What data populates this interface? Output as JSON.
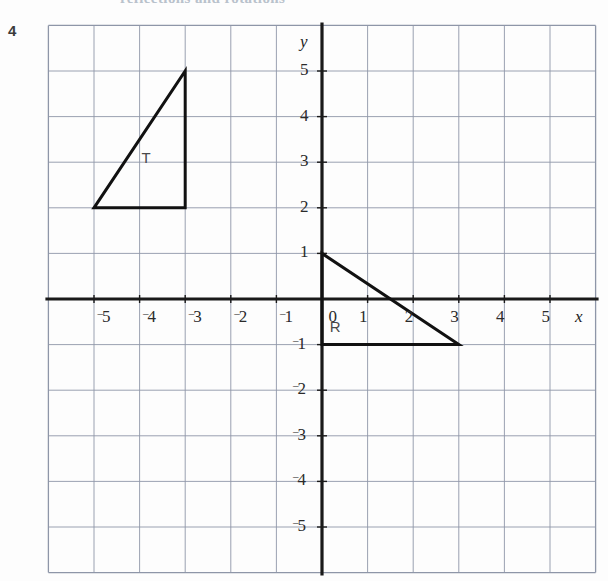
{
  "page": {
    "question_number": "4",
    "cropped_heading": "reflections and rotations"
  },
  "axes": {
    "x_axis_name": "x",
    "y_axis_name": "y",
    "origin_label": "0",
    "x_tick_labels": [
      "⁻5",
      "⁻4",
      "⁻3",
      "⁻2",
      "⁻1",
      "0",
      "1",
      "2",
      "3",
      "4",
      "5"
    ],
    "y_tick_labels": [
      "5",
      "4",
      "3",
      "2",
      "1",
      "⁻1",
      "⁻2",
      "⁻3",
      "⁻4",
      "⁻5"
    ],
    "grid_color": "#8e96a8",
    "axis_color": "#1a1a1a",
    "shape_color": "#111111"
  },
  "shapes": [
    {
      "label": "T",
      "label_position": {
        "x": -3.85,
        "y": 3.1
      },
      "vertices": [
        {
          "x": -5,
          "y": 2
        },
        {
          "x": -3,
          "y": 2
        },
        {
          "x": -3,
          "y": 5
        }
      ]
    },
    {
      "label": "R",
      "label_position": {
        "x": 0.28,
        "y": -0.62
      },
      "vertices": [
        {
          "x": 0,
          "y": 1
        },
        {
          "x": 0,
          "y": -1
        },
        {
          "x": 3,
          "y": -1
        }
      ]
    }
  ],
  "chart_data": {
    "type": "scatter",
    "title": "",
    "xlabel": "x",
    "ylabel": "y",
    "xlim": [
      -6,
      6
    ],
    "ylim": [
      -6,
      6
    ],
    "grid": true,
    "legend": "none",
    "x_ticks": [
      -5,
      -4,
      -3,
      -2,
      -1,
      0,
      1,
      2,
      3,
      4,
      5
    ],
    "y_ticks": [
      5,
      4,
      3,
      2,
      1,
      -1,
      -2,
      -3,
      -4,
      -5
    ],
    "annotations": [
      {
        "name": "T",
        "type": "triangle",
        "points": [
          [
            -5,
            2
          ],
          [
            -3,
            2
          ],
          [
            -3,
            5
          ]
        ]
      },
      {
        "name": "R",
        "type": "triangle",
        "points": [
          [
            0,
            1
          ],
          [
            0,
            -1
          ],
          [
            3,
            -1
          ]
        ]
      }
    ]
  }
}
